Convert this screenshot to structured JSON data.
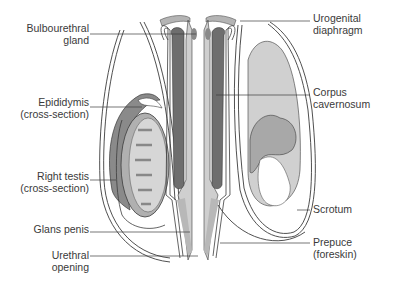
{
  "diagram": {
    "colors": {
      "outline": "#3c3c3c",
      "light_fill": "#c8c8c8",
      "mid_fill": "#b4b4b4",
      "dark_fill": "#6e6e6e",
      "testis_fill": "#d6d6d6",
      "background": "#ffffff"
    },
    "labels": {
      "left": [
        {
          "id": "bulbourethral",
          "line1": "Bulbourethral",
          "line2": "gland"
        },
        {
          "id": "epididymis",
          "line1": "Epididymis",
          "line2": "(cross-section)"
        },
        {
          "id": "right_testis",
          "line1": "Right testis",
          "line2": "(cross-section)"
        },
        {
          "id": "glans",
          "line1": "Glans penis",
          "line2": ""
        },
        {
          "id": "urethral_opening",
          "line1": "Urethral",
          "line2": "opening"
        }
      ],
      "right": [
        {
          "id": "urogenital",
          "line1": "Urogenital",
          "line2": "diaphragm"
        },
        {
          "id": "corpus",
          "line1": "Corpus",
          "line2": "cavernosum"
        },
        {
          "id": "scrotum",
          "line1": "Scrotum",
          "line2": ""
        },
        {
          "id": "prepuce",
          "line1": "Prepuce",
          "line2": "(foreskin)"
        }
      ]
    }
  }
}
